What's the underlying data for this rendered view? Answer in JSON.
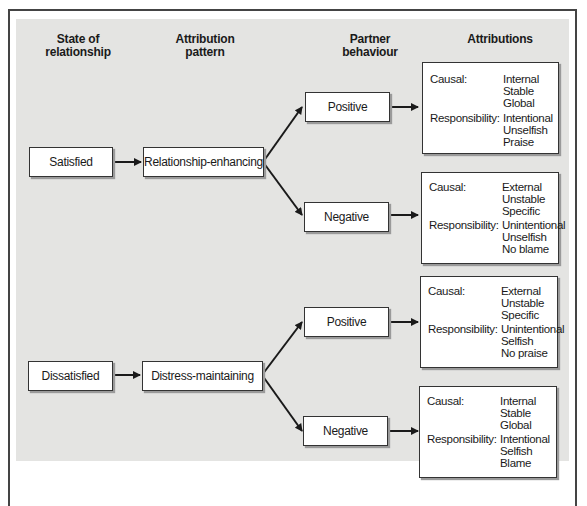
{
  "headers": {
    "state": [
      "State of",
      "relationship"
    ],
    "pattern": [
      "Attribution",
      "pattern"
    ],
    "behaviour": [
      "Partner",
      "behaviour"
    ],
    "attributions": [
      "Attributions"
    ]
  },
  "states": [
    {
      "label": "Satisfied",
      "pattern": "Relationship-enhancing"
    },
    {
      "label": "Dissatisfied",
      "pattern": "Distress-maintaining"
    }
  ],
  "behaviours": [
    "Positive",
    "Negative",
    "Positive",
    "Negative"
  ],
  "attributions": [
    {
      "causal_label": "Causal:",
      "causal": [
        "Internal",
        "Stable",
        "Global"
      ],
      "resp_label": "Responsibility:",
      "responsibility": [
        "Intentional",
        "Unselfish",
        "Praise"
      ]
    },
    {
      "causal_label": "Causal:",
      "causal": [
        "External",
        "Unstable",
        "Specific"
      ],
      "resp_label": "Responsibility:",
      "responsibility": [
        "Unintentional",
        "Unselfish",
        "No blame"
      ]
    },
    {
      "causal_label": "Causal:",
      "causal": [
        "External",
        "Unstable",
        "Specific"
      ],
      "resp_label": "Responsibility:",
      "responsibility": [
        "Unintentional",
        "Selfish",
        "No praise"
      ]
    },
    {
      "causal_label": "Causal:",
      "causal": [
        "Internal",
        "Stable",
        "Global"
      ],
      "resp_label": "Responsibility:",
      "responsibility": [
        "Intentional",
        "Selfish",
        "Blame"
      ]
    }
  ],
  "colors": {
    "panel": "#e4e4e2",
    "box": "#ffffff",
    "line": "#1a1a1a"
  }
}
